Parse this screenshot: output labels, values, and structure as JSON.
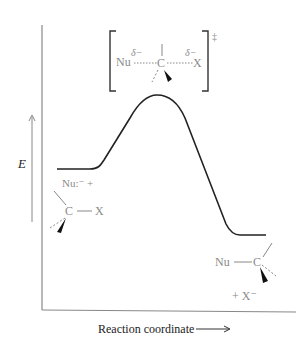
{
  "diagram": {
    "type": "reaction-energy-profile",
    "y_axis_label": "E",
    "x_axis_label": "Reaction coordinate",
    "transition_state": {
      "nucleophile": "Nu",
      "nu_charge": "δ−",
      "carbon": "C",
      "leaving_group": "X",
      "x_charge": "δ−",
      "double_dagger": "‡"
    },
    "reactants": {
      "nucleophile": "Nu:⁻ +",
      "carbon": "C",
      "leaving_group": "X"
    },
    "products": {
      "nucleophile": "Nu",
      "carbon": "C",
      "leaving_group": "+ X⁻"
    },
    "colors": {
      "curve": "#222222",
      "axis": "#888888",
      "structure_text": "#8a8a8a"
    }
  }
}
